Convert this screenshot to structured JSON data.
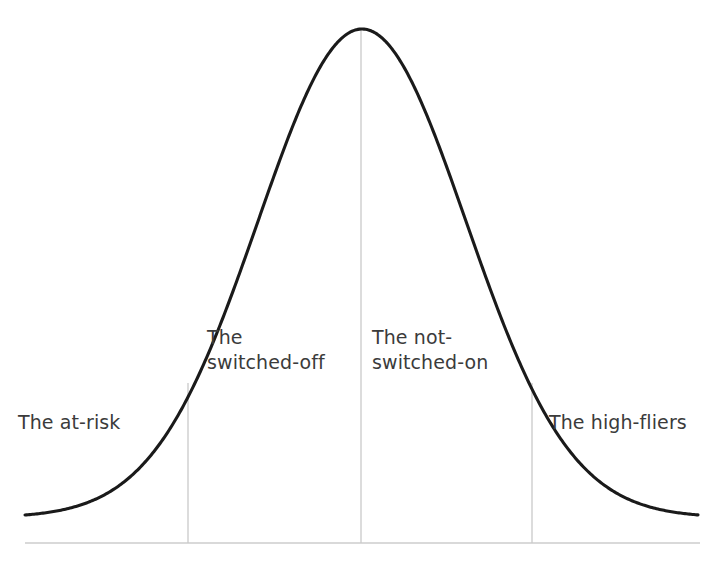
{
  "figure": {
    "background_color": "#ffffff",
    "width": 719,
    "height": 561,
    "curve_color": "#1a1a1a",
    "curve_stroke_width": 3.1,
    "divider_color": "#c9c9c9",
    "axis_color": "#cdcdcd",
    "text_color": "#3b3b3b"
  },
  "labels": {
    "at_risk": "The at-risk",
    "switched_off": "The\nswitched-off",
    "not_switched_on": "The not-\nswitched-on",
    "high_fliers": "The high-fliers"
  },
  "chart_data": {
    "type": "line",
    "title": "",
    "subtitle": "",
    "xlabel": "",
    "ylabel": "",
    "grid": false,
    "legend": "none",
    "curve": {
      "name": "Normal distribution",
      "shape": "gaussian",
      "peak_x_px": 362,
      "peak_y_px": 29,
      "baseline_y_px": 543,
      "left_tail_x_px": 25,
      "right_tail_x_px": 698,
      "tail_y_px": 515,
      "sigma_px": 104,
      "half_width_half_max_px": 122
    },
    "dividers": [
      {
        "label": "The at-risk / The switched-off boundary",
        "x_px": 188,
        "top_y_px": 383,
        "bottom_y_px": 543
      },
      {
        "label": "The switched-off / The not-switched-on boundary",
        "x_px": 361,
        "top_y_px": 29,
        "bottom_y_px": 543
      },
      {
        "label": "The not-switched-on / The high-fliers boundary",
        "x_px": 532,
        "top_y_px": 383,
        "bottom_y_px": 543
      }
    ],
    "axis": {
      "baseline_y_px": 543,
      "x_start_px": 25,
      "x_end_px": 700,
      "ticks": [],
      "tick_labels": []
    },
    "segments": [
      {
        "name": "The at-risk",
        "x_range_px": [
          25,
          188
        ],
        "label_x_px": 18,
        "label_y_px": 410,
        "lines": [
          "The at-risk"
        ]
      },
      {
        "name": "The switched-off",
        "x_range_px": [
          188,
          361
        ],
        "label_x_px": 207,
        "label_y_px": 325,
        "lines": [
          "The",
          "switched-off"
        ]
      },
      {
        "name": "The not-switched-on",
        "x_range_px": [
          361,
          532
        ],
        "label_x_px": 372,
        "label_y_px": 325,
        "lines": [
          "The not-",
          "switched-on"
        ]
      },
      {
        "name": "The high-fliers",
        "x_range_px": [
          532,
          698
        ],
        "label_x_px": 549,
        "label_y_px": 410,
        "lines": [
          "The high-fliers"
        ]
      }
    ],
    "categories": [
      "The at-risk",
      "The switched-off",
      "The not-switched-on",
      "The high-fliers"
    ],
    "values": [
      null,
      null,
      null,
      null
    ]
  }
}
